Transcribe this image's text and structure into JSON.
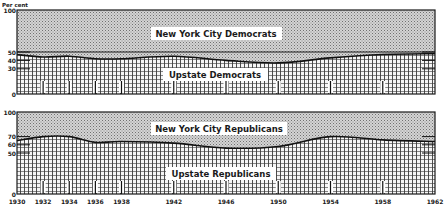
{
  "chart_data": [
    {
      "type": "area",
      "title": "Democrats",
      "ylabel": "Per cent",
      "ylim": [
        0,
        100
      ],
      "yticks": [
        0,
        30,
        40,
        50,
        100
      ],
      "x": [
        1930,
        1932,
        1934,
        1936,
        1938,
        1942,
        1946,
        1950,
        1954,
        1958,
        1962
      ],
      "xtick_labels": [
        "1930",
        "1932",
        "1934",
        "1936",
        "1938",
        "1942",
        "1946",
        "1950",
        "1954",
        "1958",
        "1962"
      ],
      "series": [
        {
          "name": "Upstate Democrats",
          "values": [
            47,
            44,
            45,
            42,
            42,
            45,
            40,
            37,
            43,
            47,
            48
          ]
        },
        {
          "name": "New York City Democrats",
          "values": [
            53,
            56,
            55,
            58,
            58,
            55,
            60,
            63,
            57,
            53,
            52
          ]
        }
      ],
      "reference_line": 50,
      "stacked": true
    },
    {
      "type": "area",
      "title": "Republicans",
      "ylabel": "",
      "ylim": [
        0,
        100
      ],
      "yticks": [
        0,
        50,
        60,
        70,
        100
      ],
      "x": [
        1930,
        1932,
        1934,
        1936,
        1938,
        1942,
        1946,
        1950,
        1954,
        1958,
        1962
      ],
      "xtick_labels": [
        "1930",
        "1932",
        "1934",
        "1936",
        "1938",
        "1942",
        "1946",
        "1950",
        "1954",
        "1958",
        "1962"
      ],
      "series": [
        {
          "name": "Upstate Republicans",
          "values": [
            65,
            70,
            70,
            63,
            64,
            62,
            56,
            58,
            70,
            66,
            64
          ]
        },
        {
          "name": "New York City Republicans",
          "values": [
            35,
            30,
            30,
            37,
            36,
            38,
            44,
            42,
            30,
            34,
            36
          ]
        }
      ],
      "stacked": true
    }
  ],
  "labels": {
    "y_unit": "Per cent",
    "top_upper": "New York City Democrats",
    "top_lower": "Upstate Democrats",
    "bottom_upper": "New York City Republicans",
    "bottom_lower": "Upstate Republicans"
  },
  "colors": {
    "ink": "#1a1a1a",
    "stipple_bg": "#c8c8c8",
    "grid_bg": "#f4f4f4"
  }
}
